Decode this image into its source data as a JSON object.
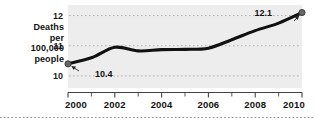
{
  "chart_data": {
    "type": "line",
    "title": "",
    "xlabel": "",
    "ylabel": "Deaths per 100,000 people",
    "ylabel_lines": [
      "Deaths",
      "per",
      "100,000",
      "people"
    ],
    "x": [
      2000,
      2001,
      2002,
      2003,
      2004,
      2005,
      2006,
      2007,
      2008,
      2009,
      2010
    ],
    "values": [
      10.4,
      10.6,
      10.95,
      10.83,
      10.87,
      10.88,
      10.92,
      11.2,
      11.5,
      11.75,
      12.1
    ],
    "series": [
      {
        "name": "Deaths per 100,000 people",
        "values": [
          10.4,
          10.6,
          10.95,
          10.83,
          10.87,
          10.88,
          10.92,
          11.2,
          11.5,
          11.75,
          12.1
        ]
      }
    ],
    "xlim": [
      2000,
      2010
    ],
    "ylim": [
      9.6,
      12.35
    ],
    "xticks": [
      2000,
      2001,
      2002,
      2003,
      2004,
      2005,
      2006,
      2007,
      2008,
      2009,
      2010
    ],
    "xtick_labels": [
      "2000",
      "",
      "2002",
      "",
      "2004",
      "",
      "2006",
      "",
      "2008",
      "",
      "2010"
    ],
    "yticks": [
      10,
      11,
      12
    ],
    "ytick_labels": [
      "10",
      "11",
      "12"
    ],
    "grid": true,
    "grid_style": "dotted",
    "legend": false,
    "annotations": [
      {
        "text": "10.4",
        "point_x": 2000,
        "point_y": 10.4
      },
      {
        "text": "12.1",
        "point_x": 2010,
        "point_y": 12.1
      }
    ],
    "markers": [
      {
        "x": 2000,
        "y": 10.4
      },
      {
        "x": 2010,
        "y": 12.1
      }
    ],
    "colors": {
      "line": "#111111",
      "plot_background": "#ededed",
      "grid": "#a8a8a8",
      "axis": "#444444",
      "text": "#111111",
      "marker": "#666666",
      "footer_rule": "#8c8c8c"
    }
  }
}
